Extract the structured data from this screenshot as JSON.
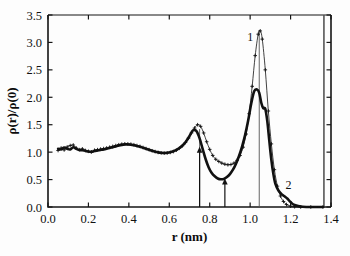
{
  "figure": {
    "title": "",
    "background_color": "#fdfdfd",
    "ink_color": "#111111"
  },
  "axes": {
    "x_label": "r (nm)",
    "y_label": "ρ(r)/ρ(0)",
    "x_ticks": [
      "0.0",
      "0.2",
      "0.4",
      "0.6",
      "0.8",
      "1.0",
      "1.2",
      "1.4"
    ],
    "y_ticks": [
      "0.0",
      "0.5",
      "1.0",
      "1.5",
      "2.0",
      "2.5",
      "3.0",
      "3.5"
    ],
    "xlim": [
      0.0,
      1.4
    ],
    "ylim": [
      0.0,
      3.5
    ],
    "grid": false
  },
  "annotations": {
    "curve1_label": "1",
    "curve2_label": "2",
    "arrow1_r": "0.75",
    "arrow2_r": "0.875",
    "vline1_r": "0.75",
    "vline2_r": "1.045",
    "vline3_r": "1.365"
  },
  "chart_data": {
    "type": "line",
    "title": "",
    "xlabel": "r (nm)",
    "ylabel": "ρ(r)/ρ(0)",
    "xlim": [
      0.0,
      1.4
    ],
    "ylim": [
      0.0,
      3.5
    ],
    "grid": false,
    "legend_position": "inline-labels",
    "xticks": [
      0.0,
      0.2,
      0.4,
      0.6,
      0.8,
      1.0,
      1.2,
      1.4
    ],
    "yticks": [
      0.0,
      0.5,
      1.0,
      1.5,
      2.0,
      2.5,
      3.0,
      3.5
    ],
    "annotations": [
      {
        "text": "1",
        "x": 1.0,
        "y": 3.02,
        "describes": "thin sharp curve peaking at 3.2"
      },
      {
        "text": "2",
        "x": 1.19,
        "y": 0.33,
        "describes": "thick broad curve tail"
      },
      {
        "text": "arrow-up",
        "x": 0.75,
        "y_from": 0.0,
        "y_to": 1.1
      },
      {
        "text": "arrow-up",
        "x": 0.875,
        "y_from": 0.0,
        "y_to": 0.52
      },
      {
        "text": "vline",
        "x": 0.75,
        "y_from": 0.0,
        "y_to": 1.42
      },
      {
        "text": "vline",
        "x": 1.045,
        "y_from": 0.0,
        "y_to": 3.22
      },
      {
        "text": "vline",
        "x": 1.365,
        "y_from": 0.0,
        "y_to": 3.5
      }
    ],
    "series": [
      {
        "name": "1",
        "style": "thin line with plus markers",
        "marker": "+",
        "linewidth": 0.8,
        "x": [
          0.05,
          0.065,
          0.08,
          0.095,
          0.11,
          0.125,
          0.14,
          0.155,
          0.17,
          0.185,
          0.2,
          0.215,
          0.23,
          0.245,
          0.26,
          0.275,
          0.29,
          0.305,
          0.32,
          0.335,
          0.35,
          0.365,
          0.38,
          0.395,
          0.41,
          0.425,
          0.44,
          0.455,
          0.47,
          0.485,
          0.5,
          0.515,
          0.53,
          0.545,
          0.56,
          0.575,
          0.59,
          0.605,
          0.62,
          0.635,
          0.65,
          0.665,
          0.68,
          0.695,
          0.71,
          0.725,
          0.74,
          0.755,
          0.77,
          0.785,
          0.8,
          0.815,
          0.83,
          0.845,
          0.86,
          0.875,
          0.89,
          0.905,
          0.92,
          0.935,
          0.95,
          0.965,
          0.98,
          0.995,
          1.01,
          1.025,
          1.04,
          1.05,
          1.06,
          1.075,
          1.09,
          1.105,
          1.12,
          1.135,
          1.15,
          1.165,
          1.18,
          1.2,
          1.22,
          1.25,
          1.3,
          1.36
        ],
        "y": [
          1.03,
          1.075,
          1.04,
          1.095,
          1.12,
          1.13,
          1.075,
          1.045,
          1.06,
          1.03,
          1.015,
          1.005,
          1.035,
          1.045,
          1.055,
          1.065,
          1.075,
          1.09,
          1.105,
          1.12,
          1.135,
          1.145,
          1.152,
          1.15,
          1.145,
          1.135,
          1.12,
          1.105,
          1.085,
          1.065,
          1.045,
          1.025,
          1.01,
          0.995,
          0.985,
          0.982,
          0.985,
          0.995,
          1.01,
          1.035,
          1.07,
          1.115,
          1.175,
          1.255,
          1.35,
          1.44,
          1.5,
          1.47,
          1.35,
          1.19,
          1.05,
          0.94,
          0.87,
          0.83,
          0.8,
          0.78,
          0.77,
          0.775,
          0.8,
          0.85,
          0.94,
          1.09,
          1.33,
          1.7,
          2.2,
          2.76,
          3.15,
          3.21,
          3.06,
          2.5,
          1.75,
          1.15,
          0.68,
          0.38,
          0.2,
          0.1,
          0.045,
          0.015,
          0.005,
          0.0,
          0.0,
          0.0
        ]
      },
      {
        "name": "2",
        "style": "thick dense line",
        "marker": "none",
        "linewidth": 2.6,
        "x": [
          0.05,
          0.065,
          0.08,
          0.095,
          0.11,
          0.125,
          0.14,
          0.155,
          0.17,
          0.185,
          0.2,
          0.215,
          0.23,
          0.245,
          0.26,
          0.275,
          0.29,
          0.305,
          0.32,
          0.335,
          0.35,
          0.365,
          0.38,
          0.395,
          0.41,
          0.425,
          0.44,
          0.455,
          0.47,
          0.485,
          0.5,
          0.515,
          0.53,
          0.545,
          0.56,
          0.575,
          0.59,
          0.605,
          0.62,
          0.635,
          0.65,
          0.665,
          0.68,
          0.695,
          0.71,
          0.72,
          0.735,
          0.75,
          0.765,
          0.78,
          0.795,
          0.81,
          0.825,
          0.84,
          0.855,
          0.87,
          0.885,
          0.9,
          0.915,
          0.93,
          0.945,
          0.96,
          0.975,
          0.99,
          1.005,
          1.02,
          1.035,
          1.045,
          1.055,
          1.065,
          1.075,
          1.085,
          1.095,
          1.105,
          1.115,
          1.125,
          1.14,
          1.155,
          1.17,
          1.185,
          1.2,
          1.22,
          1.26,
          1.32,
          1.36
        ],
        "y": [
          1.06,
          1.05,
          1.085,
          1.06,
          1.05,
          1.09,
          1.06,
          1.04,
          1.035,
          1.025,
          1.01,
          1.005,
          1.02,
          1.03,
          1.04,
          1.05,
          1.062,
          1.075,
          1.09,
          1.105,
          1.12,
          1.132,
          1.14,
          1.14,
          1.135,
          1.125,
          1.112,
          1.098,
          1.08,
          1.062,
          1.042,
          1.024,
          1.008,
          0.996,
          0.988,
          0.985,
          0.988,
          0.998,
          1.015,
          1.04,
          1.075,
          1.12,
          1.18,
          1.262,
          1.36,
          1.405,
          1.38,
          1.25,
          1.06,
          0.87,
          0.72,
          0.62,
          0.56,
          0.52,
          0.505,
          0.512,
          0.545,
          0.6,
          0.68,
          0.79,
          0.93,
          1.1,
          1.31,
          1.57,
          1.88,
          2.11,
          2.14,
          2.08,
          1.9,
          1.8,
          1.79,
          1.56,
          1.2,
          0.86,
          0.6,
          0.42,
          0.3,
          0.235,
          0.195,
          0.15,
          0.09,
          0.035,
          0.005,
          0.0,
          0.0
        ]
      }
    ]
  }
}
